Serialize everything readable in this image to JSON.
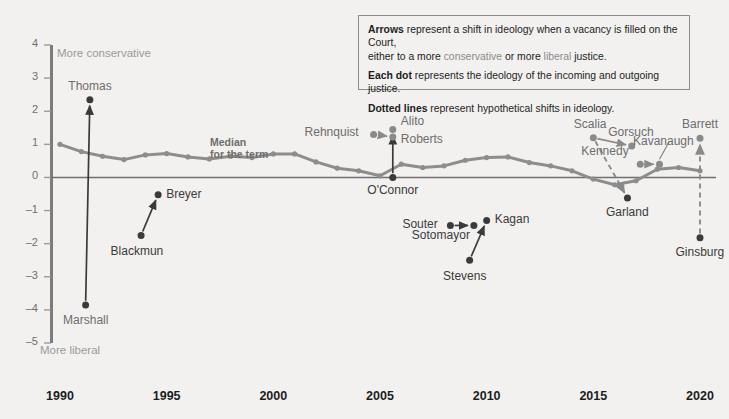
{
  "legend": {
    "line1_bold": "Arrows",
    "line1_a": " represent a shift in ideology when a vacancy is filled on the Court,",
    "line1_b": "either to a more ",
    "line1_cons": "conservative",
    "line1_c": " or more ",
    "line1_lib": "liberal",
    "line1_d": " justice.",
    "line2_bold": "Each dot",
    "line2_rest": " represents the ideology of the incoming and outgoing justice.",
    "line3_bold": "Dotted lines",
    "line3_rest": " represent hypothetical shifts in ideology."
  },
  "axes": {
    "y_ticks": [
      "4",
      "3",
      "2",
      "1",
      "0",
      "-1",
      "-2",
      "-3",
      "-4",
      "-5"
    ],
    "x_ticks": [
      "1990",
      "1995",
      "2000",
      "2005",
      "2010",
      "2015",
      "2020"
    ],
    "top_direction": "More conservative",
    "bottom_direction": "More liberal"
  },
  "annotations": {
    "median_line1": "Median",
    "median_line2": "for the term"
  },
  "justices": [
    {
      "name": "Thomas",
      "x": 1991.4,
      "y": 2.35
    },
    {
      "name": "Marshall",
      "x": 1991.2,
      "y": -3.85
    },
    {
      "name": "Blackmun",
      "x": 1993.8,
      "y": -1.75
    },
    {
      "name": "Breyer",
      "x": 1994.6,
      "y": -0.52
    },
    {
      "name": "Rehnquist",
      "x": 2004.7,
      "y": 1.3
    },
    {
      "name": "Alito",
      "x": 2005.6,
      "y": 1.45
    },
    {
      "name": "Roberts",
      "x": 2005.6,
      "y": 1.22
    },
    {
      "name": "O'Connor",
      "x": 2005.6,
      "y": 0.0
    },
    {
      "name": "Souter",
      "x": 2008.3,
      "y": -1.45
    },
    {
      "name": "Sotomayor",
      "x": 2009.4,
      "y": -1.45
    },
    {
      "name": "Stevens",
      "x": 2009.2,
      "y": -2.5
    },
    {
      "name": "Kagan",
      "x": 2010.0,
      "y": -1.3
    },
    {
      "name": "Scalia",
      "x": 2015.0,
      "y": 1.2
    },
    {
      "name": "Gorsuch",
      "x": 2016.8,
      "y": 0.95
    },
    {
      "name": "Garland",
      "x": 2016.6,
      "y": -0.62
    },
    {
      "name": "Kennedy",
      "x": 2017.2,
      "y": 0.4
    },
    {
      "name": "Kavanaugh",
      "x": 2018.1,
      "y": 0.4
    },
    {
      "name": "Ginsburg",
      "x": 2020.0,
      "y": -1.82
    },
    {
      "name": "Barrett",
      "x": 2020.0,
      "y": 1.18
    }
  ],
  "chart_data": {
    "type": "line",
    "title": "",
    "xlabel": "",
    "ylabel": "",
    "xlim": [
      1989.4,
      2020.9
    ],
    "ylim": [
      -5,
      4
    ],
    "grid": false,
    "legend_position": "top-right-box",
    "series": [
      {
        "name": "Median for the term",
        "color": "#8d8d8d",
        "x": [
          1990,
          1991,
          1992,
          1993,
          1994,
          1995,
          1996,
          1997,
          1998,
          1999,
          2000,
          2001,
          2002,
          2003,
          2004,
          2005,
          2006,
          2007,
          2008,
          2009,
          2010,
          2011,
          2012,
          2013,
          2014,
          2015,
          2016,
          2017,
          2018,
          2019,
          2020
        ],
        "values": [
          1.0,
          0.78,
          0.64,
          0.54,
          0.68,
          0.72,
          0.62,
          0.56,
          0.64,
          0.6,
          0.71,
          0.71,
          0.47,
          0.28,
          0.2,
          0.05,
          0.4,
          0.3,
          0.35,
          0.52,
          0.6,
          0.62,
          0.45,
          0.35,
          0.2,
          -0.05,
          -0.22,
          -0.1,
          0.25,
          0.3,
          0.2
        ]
      }
    ],
    "arrows": [
      {
        "from": "Marshall",
        "to": "Thomas",
        "style": "solid",
        "type": "conservative"
      },
      {
        "from": "Blackmun",
        "to": "Breyer",
        "style": "solid",
        "type": "conservative"
      },
      {
        "from": "Rehnquist",
        "to": "Roberts",
        "style": "solid",
        "type": "conservative"
      },
      {
        "from": "O'Connor",
        "to": "Alito",
        "style": "solid",
        "type": "conservative"
      },
      {
        "from": "Souter",
        "to": "Sotomayor",
        "style": "solid",
        "type": "conservative"
      },
      {
        "from": "Stevens",
        "to": "Kagan",
        "style": "solid",
        "type": "conservative"
      },
      {
        "from": "Scalia",
        "to": "Gorsuch",
        "style": "solid",
        "type": "liberal"
      },
      {
        "from": "Scalia",
        "to": "Garland",
        "style": "dotted",
        "type": "liberal"
      },
      {
        "from": "Kennedy",
        "to": "Kavanaugh",
        "style": "solid",
        "type": "conservative"
      },
      {
        "from": "Ginsburg",
        "to": "Barrett",
        "style": "dotted",
        "type": "conservative"
      }
    ]
  },
  "colors": {
    "background": "#f2f1ef",
    "median_line": "#8d8d8d",
    "axis": "#7b7b7b",
    "dot_dark": "#3a3a3a",
    "dot_gray": "#8a8a8a",
    "legend_border": "#8c8c8c"
  }
}
